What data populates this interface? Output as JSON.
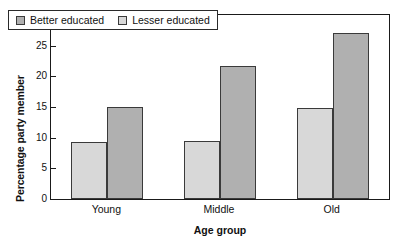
{
  "chart_data": {
    "type": "bar",
    "title": "",
    "xlabel": "Age group",
    "ylabel": "Percentage party member",
    "categories": [
      "Young",
      "Middle",
      "Old"
    ],
    "series": [
      {
        "name": "Lesser educated",
        "values": [
          9.3,
          9.4,
          14.8
        ],
        "color": "#d8d8d8"
      },
      {
        "name": "Better educated",
        "values": [
          15.0,
          21.7,
          27.0
        ],
        "color": "#b0b0b0"
      }
    ],
    "bar_order_in_group": [
      "Lesser educated",
      "Better educated"
    ],
    "ylim": [
      0,
      30
    ],
    "yticks": [
      0,
      5,
      10,
      15,
      20,
      25,
      30
    ],
    "ytick_labels": [
      "0",
      "5",
      "10",
      "15",
      "20",
      "25",
      "30"
    ],
    "grid": false,
    "legend_position": "upper-left",
    "frame": true
  },
  "legend": {
    "entries": [
      {
        "label": "Better educated",
        "swatch": "legend-swatch-better-educated"
      },
      {
        "label": "Lesser educated",
        "swatch": "legend-swatch-lesser-educated"
      }
    ]
  },
  "axes": {
    "y_title": "Percentage party member",
    "x_title": "Age group"
  }
}
